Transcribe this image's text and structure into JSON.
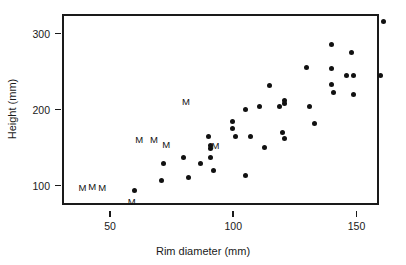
{
  "chart_data": {
    "type": "scatter",
    "title": "",
    "xlabel": "Rim diameter (mm)",
    "ylabel": "Height (mm)",
    "xlim": [
      33,
      162
    ],
    "ylim": [
      62,
      328
    ],
    "xticks": [
      50,
      100,
      150
    ],
    "xticklabels": [
      "50",
      "100",
      "150"
    ],
    "yticks": [
      100,
      200,
      300
    ],
    "yticklabels": [
      "100",
      "200",
      "300"
    ],
    "grid": false,
    "legend": null,
    "marker_color": "#111111",
    "frame_color": "#1a1a1a",
    "series": [
      {
        "name": "dot",
        "marker": "filled-circle",
        "points": [
          [
            59,
            96
          ],
          [
            70,
            109
          ],
          [
            71,
            131
          ],
          [
            79,
            140
          ],
          [
            81,
            113
          ],
          [
            86,
            131
          ],
          [
            89,
            167
          ],
          [
            90,
            155
          ],
          [
            90,
            151
          ],
          [
            90,
            139
          ],
          [
            91,
            122
          ],
          [
            99,
            187
          ],
          [
            99,
            177
          ],
          [
            100,
            167
          ],
          [
            104,
            202
          ],
          [
            104,
            116
          ],
          [
            106,
            167
          ],
          [
            110,
            207
          ],
          [
            112,
            152
          ],
          [
            114,
            234
          ],
          [
            118,
            207
          ],
          [
            119,
            173
          ],
          [
            120,
            215
          ],
          [
            120,
            211
          ],
          [
            120,
            164
          ],
          [
            129,
            258
          ],
          [
            130,
            207
          ],
          [
            132,
            184
          ],
          [
            139,
            288
          ],
          [
            139,
            257
          ],
          [
            139,
            236
          ],
          [
            140,
            225
          ],
          [
            145,
            247
          ],
          [
            147,
            277
          ],
          [
            148,
            247
          ],
          [
            148,
            222
          ],
          [
            159,
            247
          ],
          [
            160,
            318
          ]
        ]
      },
      {
        "name": "M",
        "marker": "letter-M",
        "points": [
          [
            38,
            99
          ],
          [
            42,
            101
          ],
          [
            46,
            100
          ],
          [
            58,
            81
          ],
          [
            61,
            162
          ],
          [
            67,
            163
          ],
          [
            72,
            156
          ],
          [
            80,
            212
          ],
          [
            92,
            155
          ]
        ]
      }
    ]
  }
}
